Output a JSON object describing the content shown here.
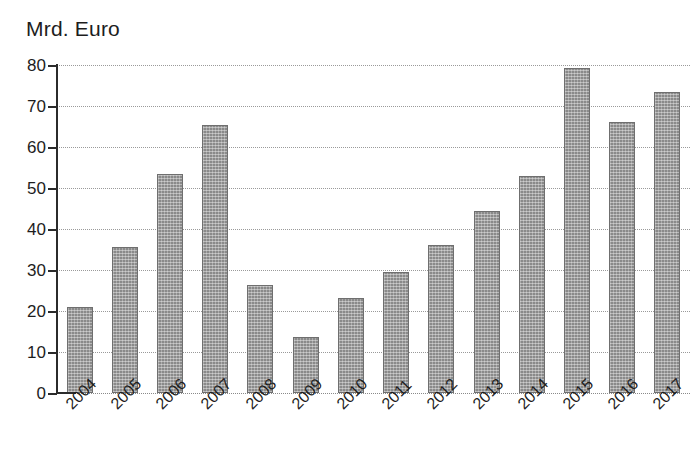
{
  "chart_data": {
    "type": "bar",
    "title": "Mrd. Euro",
    "subtitle": "",
    "xlabel": "",
    "ylabel": "Mrd. Euro",
    "categories": [
      "2004",
      "2005",
      "2006",
      "2007",
      "2008",
      "2009",
      "2010",
      "2011",
      "2012",
      "2013",
      "2014",
      "2015",
      "2016",
      "2017"
    ],
    "values": [
      21.0,
      35.6,
      53.4,
      65.4,
      26.4,
      13.6,
      23.2,
      29.4,
      36.2,
      44.5,
      52.9,
      79.2,
      66.2,
      73.3
    ],
    "ylim": [
      0,
      80
    ],
    "ytick_labels": [
      "0",
      "10",
      "20",
      "30",
      "40",
      "50",
      "60",
      "70",
      "80"
    ],
    "ytick_values": [
      0,
      10,
      20,
      30,
      40,
      50,
      60,
      70,
      80
    ],
    "grid": true,
    "grid_axis": "y",
    "grid_style": "dotted",
    "legend": false,
    "legend_position": "none",
    "bar_color": "#8a8a8a",
    "bar_edge_color": "#6f6f6f",
    "bar_pattern": "hatched-dotted",
    "axis_color": "#2b2b2b",
    "grid_color": "#9a9a9a",
    "background_color": "#ffffff",
    "text_color": "#1d1d1d",
    "xtick_rotation": -45
  }
}
